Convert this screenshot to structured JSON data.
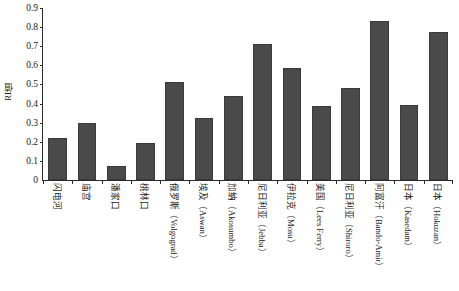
{
  "chart_data": {
    "type": "bar",
    "title": "",
    "xlabel": "",
    "ylabel": "RI值",
    "ylim": [
      0,
      0.9
    ],
    "ytick_labels": [
      "0.9",
      "0.8",
      "0.7",
      "0.6",
      "0.5",
      "0.4",
      "0.3",
      "0.2",
      "0.1",
      "0"
    ],
    "ytick_values": [
      0.9,
      0.8,
      0.7,
      0.6,
      0.5,
      0.4,
      0.3,
      0.2,
      0.1,
      0
    ],
    "grid": false,
    "legend": "none",
    "bar_color": "#4a4a4a",
    "axis_color": "#2b2b2b",
    "background_color": "#ffffff",
    "categories": [
      "闪电河",
      "庙宫",
      "潘家口",
      "桃林口",
      "俄罗斯（Volgograd）",
      "埃及（Aswan）",
      "加纳（Akosumbo）",
      "尼日利亚（Jebba）",
      "伊拉克（Mosu）",
      "美国（Lees Ferry）",
      "尼日利亚（Shiroro）",
      "阿富汗（Bando-Amir）",
      "日本（Kasedam）",
      "日本（Hokuzan）"
    ],
    "values": [
      0.22,
      0.3,
      0.075,
      0.195,
      0.515,
      0.325,
      0.44,
      0.71,
      0.585,
      0.385,
      0.48,
      0.83,
      0.39,
      0.775
    ]
  }
}
